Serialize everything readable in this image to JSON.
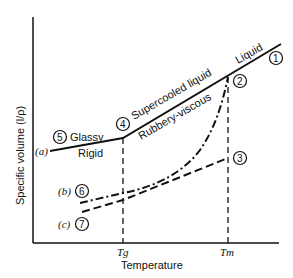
{
  "diagram": {
    "type": "specific-volume-vs-temperature",
    "axes": {
      "ylabel": "Specific volume (l/ρ)",
      "xlabel": "Temperature",
      "x_ticks": [
        "Tg",
        "Tm"
      ]
    },
    "regions": {
      "liquid": "Liquid",
      "supercooled": "Supercooled liquid",
      "rubbery": "Rubbery-viscous",
      "glassy": "Glassy",
      "rigid": "Rigid"
    },
    "points": [
      {
        "id": "1",
        "label": "1"
      },
      {
        "id": "2",
        "label": "2"
      },
      {
        "id": "3",
        "label": "3"
      },
      {
        "id": "4",
        "label": "4"
      },
      {
        "id": "5",
        "label": "5"
      },
      {
        "id": "6",
        "label": "6"
      },
      {
        "id": "7",
        "label": "7"
      }
    ],
    "curves": [
      {
        "id": "a",
        "label": "(a)",
        "style": "solid",
        "description": "amorphous: liquid → supercooled → glassy"
      },
      {
        "id": "b",
        "label": "(b)",
        "style": "dash-dot",
        "description": "semicrystalline: rubbery-viscous path from Tm"
      },
      {
        "id": "c",
        "label": "(c)",
        "style": "dashed",
        "description": "crystalline: from point 3 at Tm"
      }
    ]
  }
}
